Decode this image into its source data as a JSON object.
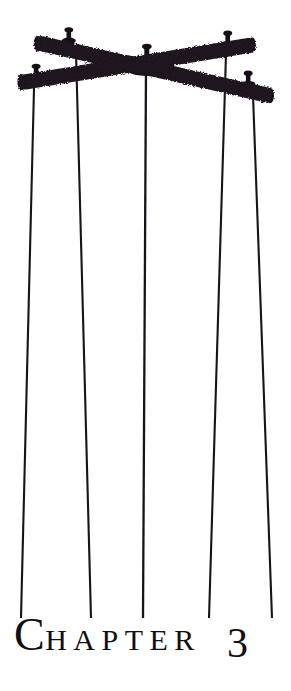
{
  "page": {
    "kind": "book-chapter-opening",
    "background_color": "#ffffff",
    "ink_color": "#110f12"
  },
  "heading": {
    "drop_cap": "C",
    "rest_of_word": "HAPTER",
    "full_label": "CHAPTER",
    "number": "3"
  },
  "illustration": {
    "name": "marionette-control-bars",
    "description": "Two crossed wooden marionette control bars with five strings hanging down",
    "ink_color": "#121012",
    "bars": [
      {
        "name": "bar-upper-left-to-lower-right",
        "x1": 44,
        "y1": 44,
        "x2": 272,
        "y2": 96,
        "thickness": 15
      },
      {
        "name": "bar-lower-left-to-upper-right",
        "x1": 24,
        "y1": 84,
        "x2": 249,
        "y2": 47,
        "thickness": 15
      }
    ],
    "pegs": [
      {
        "name": "peg-upper-left",
        "x": 69,
        "y": 38
      },
      {
        "name": "peg-lower-left",
        "x": 36,
        "y": 75
      },
      {
        "name": "peg-center",
        "x": 147,
        "y": 56
      },
      {
        "name": "peg-upper-right",
        "x": 228,
        "y": 42
      },
      {
        "name": "peg-lower-right",
        "x": 248,
        "y": 82
      }
    ],
    "strings": [
      {
        "name": "string-1-far-left",
        "x_top": 34,
        "y_top": 88,
        "x_bottom": 21,
        "y_bottom": 618
      },
      {
        "name": "string-2-left",
        "x_top": 76,
        "y_top": 52,
        "x_bottom": 91,
        "y_bottom": 618
      },
      {
        "name": "string-3-center",
        "x_top": 146,
        "y_top": 68,
        "x_bottom": 143,
        "y_bottom": 618
      },
      {
        "name": "string-4-right",
        "x_top": 226,
        "y_top": 54,
        "x_bottom": 209,
        "y_bottom": 618
      },
      {
        "name": "string-5-far-right",
        "x_top": 253,
        "y_top": 95,
        "x_bottom": 272,
        "y_bottom": 618
      }
    ],
    "string_width": 2.1,
    "string_count": 5
  }
}
